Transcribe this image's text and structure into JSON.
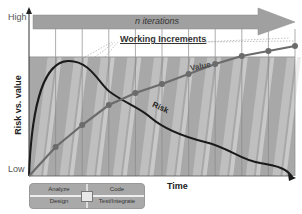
{
  "diagram": {
    "banner": "n iterations",
    "working_increments": "Working Increments",
    "y_axis": {
      "title": "Risk vs. value",
      "high": "High",
      "low": "Low"
    },
    "x_axis": {
      "title": "Time"
    },
    "curves": {
      "value": {
        "label": "Value",
        "color": "#6b6b6b",
        "points": [
          0.0,
          0.18,
          0.32,
          0.42,
          0.49,
          0.55,
          0.62,
          0.66,
          0.68,
          0.69
        ]
      },
      "risk": {
        "label": "Risk",
        "color": "#1a1a1a"
      }
    },
    "iterations": 10,
    "legend": {
      "items": [
        "Analyze",
        "Code",
        "Design",
        "Test/Integrate"
      ]
    },
    "colors": {
      "band": "#a6a6a6",
      "banner": "#a0a0a0",
      "grid": "#888888"
    }
  }
}
